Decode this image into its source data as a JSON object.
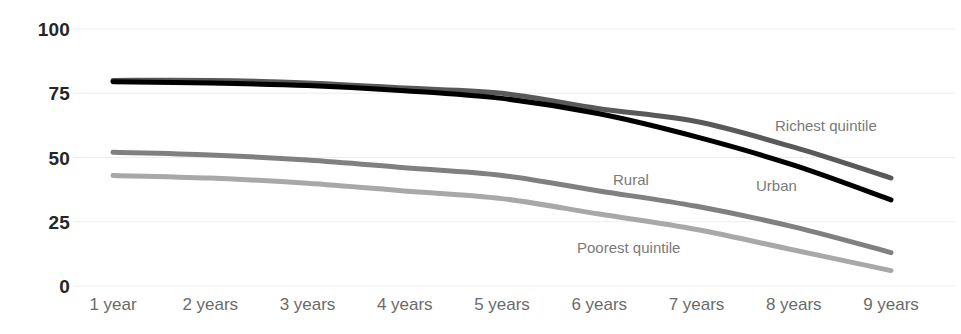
{
  "chart": {
    "title": "",
    "background_color": "#ffffff",
    "gridline_color": "#ededed",
    "axis_label_color": "#262626",
    "tick_label_color": "#6b6b6b",
    "series_label_color": "#7a7a7a"
  },
  "y_axis": {
    "ticks": [
      "0",
      "25",
      "50",
      "75",
      "100"
    ]
  },
  "x_axis": {
    "ticks": [
      "1 year",
      "2 years",
      "3 years",
      "4 years",
      "5 years",
      "6 years",
      "7 years",
      "8 years",
      "9 years"
    ]
  },
  "series_labels": {
    "richest": "Richest quintile",
    "urban": "Urban",
    "rural": "Rural",
    "poorest": "Poorest quintile"
  },
  "chart_data": {
    "type": "line",
    "title": "",
    "xlabel": "",
    "ylabel": "",
    "ylim": [
      0,
      100
    ],
    "yticks": [
      0,
      25,
      50,
      75,
      100
    ],
    "grid": true,
    "legend": "inline-annotations",
    "categories": [
      "1 year",
      "2 years",
      "3 years",
      "4 years",
      "5 years",
      "6 years",
      "7 years",
      "8 years",
      "9 years"
    ],
    "series": [
      {
        "name": "Richest quintile",
        "color": "#595959",
        "values": [
          80,
          80,
          79,
          77,
          75,
          69,
          64,
          54,
          42
        ]
      },
      {
        "name": "Urban",
        "color": "#000000",
        "values": [
          79.5,
          79,
          78,
          76,
          73,
          67,
          58,
          47,
          33.5
        ]
      },
      {
        "name": "Rural",
        "color": "#808080",
        "values": [
          52,
          51,
          49,
          46,
          43,
          37,
          31,
          23,
          13
        ]
      },
      {
        "name": "Poorest quintile",
        "color": "#a8a8a8",
        "values": [
          43,
          42,
          40,
          37,
          34,
          28,
          22,
          14,
          6
        ]
      }
    ]
  }
}
